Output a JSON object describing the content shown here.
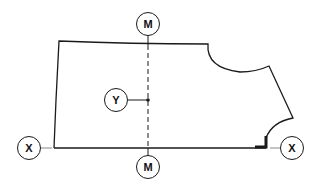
{
  "diagram": {
    "type": "pattern-drafting-diagram",
    "stroke_color": "#1a1a1a",
    "background": "#ffffff",
    "labels": {
      "m_top": "M",
      "m_bottom": "M",
      "y": "Y",
      "x_left": "X",
      "x_right": "X"
    },
    "elements": [
      {
        "name": "pattern-outline",
        "description": "Bodice/garment pattern piece outline with armhole and neck curves"
      },
      {
        "name": "center-line-M",
        "description": "Dashed vertical line M–M through pattern"
      },
      {
        "name": "point-Y",
        "description": "Marked point Y on line M–M"
      },
      {
        "name": "baseline-X",
        "description": "Horizontal base line X–X"
      },
      {
        "name": "right-angle-mark",
        "description": "Right-angle marker at neck/baseline corner"
      }
    ]
  }
}
